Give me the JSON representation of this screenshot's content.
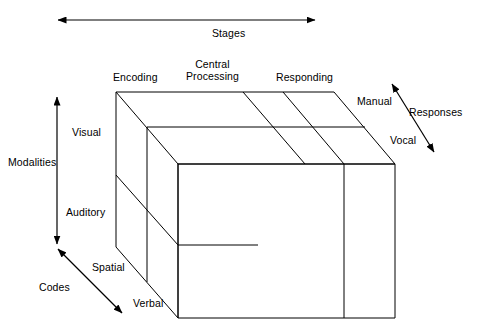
{
  "figure": {
    "background_color": "#ffffff",
    "line_color": "#000000",
    "text_color": "#000000"
  },
  "axes": [
    {
      "id": "stages",
      "label": "Stages",
      "orientation": "horizontal",
      "arrow": "double"
    },
    {
      "id": "modalities",
      "label": "Modalities",
      "orientation": "vertical",
      "arrow": "double"
    },
    {
      "id": "codes",
      "label": "Codes",
      "orientation": "diagonal",
      "arrow": "double"
    },
    {
      "id": "responses",
      "label": "Responses",
      "orientation": "diagonal",
      "arrow": "double"
    }
  ],
  "dimensions": {
    "stages": {
      "axis_label": "Stages",
      "levels": [
        {
          "label": "Encoding"
        },
        {
          "label": "Central\nProcessing"
        },
        {
          "label": "Responding"
        }
      ]
    },
    "modalities": {
      "axis_label": "Modalities",
      "levels": [
        {
          "label": "Visual"
        },
        {
          "label": "Auditory"
        }
      ]
    },
    "codes": {
      "axis_label": "Codes",
      "levels": [
        {
          "label": "Spatial"
        },
        {
          "label": "Verbal"
        }
      ]
    },
    "responses": {
      "axis_label": "Responses",
      "levels": [
        {
          "label": "Manual"
        },
        {
          "label": "Vocal"
        }
      ]
    }
  }
}
